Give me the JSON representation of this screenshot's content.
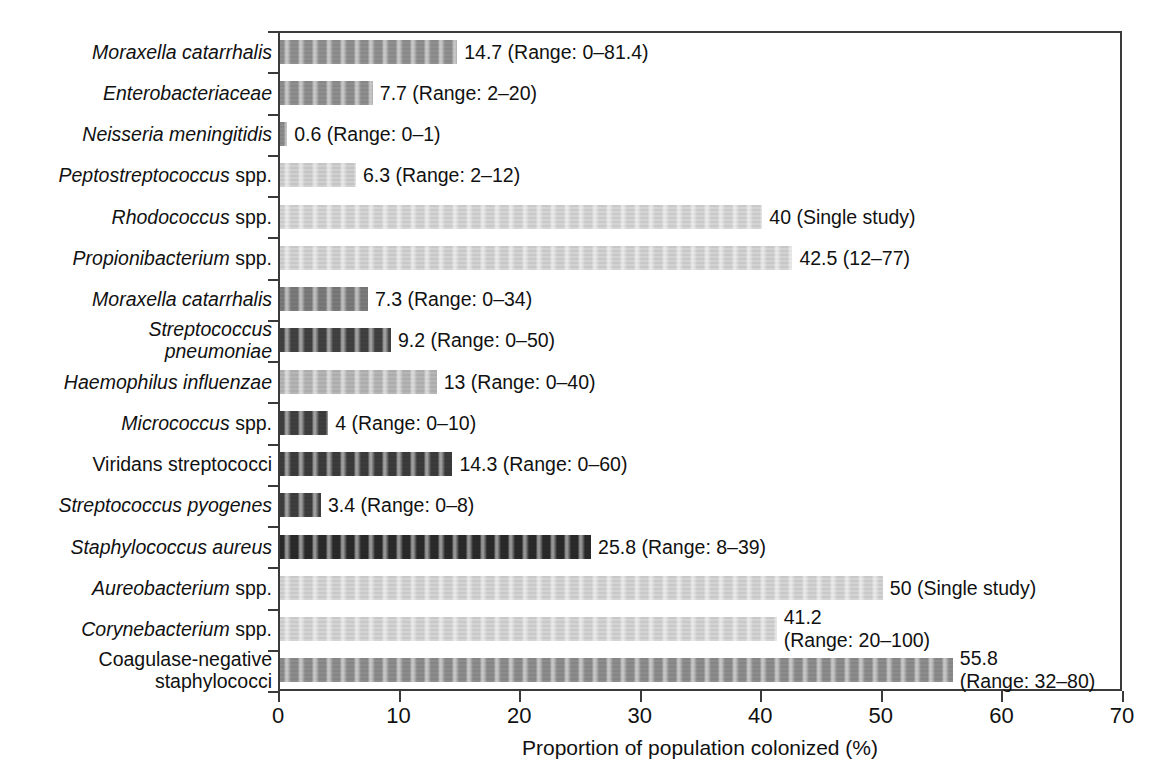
{
  "chart_data": {
    "type": "bar",
    "orientation": "horizontal",
    "title": "",
    "xlabel": "Proportion of population colonized (%)",
    "ylabel": "",
    "xlim": [
      0,
      70
    ],
    "xticks": [
      0,
      10,
      20,
      30,
      40,
      50,
      60,
      70
    ],
    "xtick_labels": [
      "0",
      "10",
      "20",
      "30",
      "40",
      "50",
      "60",
      "70"
    ],
    "grid": false,
    "legend": "none",
    "categories": [
      "Moraxella catarrhalis",
      "Enterobacteriaceae",
      "Neisseria meningitidis",
      "Peptostreptococcus spp.",
      "Rhodococcus spp.",
      "Propionibacterium spp.",
      "Moraxella catarrhalis",
      "Streptococcus\npneumoniae",
      "Haemophilus influenzae",
      "Micrococcus spp.",
      "Viridans streptococci",
      "Streptococcus pyogenes",
      "Staphylococcus aureus",
      "Aureobacterium spp.",
      "Corynebacterium spp.",
      "Coagulase-negative\nstaphylococci"
    ],
    "values": [
      14.7,
      7.7,
      0.6,
      6.3,
      40,
      42.5,
      7.3,
      9.2,
      13,
      4,
      14.3,
      3.4,
      25.8,
      50,
      41.2,
      55.8
    ],
    "value_labels": [
      "14.7 (Range: 0–81.4)",
      "7.7 (Range: 2–20)",
      "0.6 (Range: 0–1)",
      "6.3 (Range: 2–12)",
      "40 (Single study)",
      "42.5 (12–77)",
      "7.3 (Range: 0–34)",
      "9.2 (Range: 0–50)",
      "13 (Range: 0–40)",
      "4 (Range: 0–10)",
      "14.3 (Range: 0–60)",
      "3.4 (Range: 0–8)",
      "25.8 (Range: 8–39)",
      "50 (Single study)",
      "41.2\n(Range: 20–100)",
      "55.8\n(Range: 32–80)"
    ],
    "bar_colors": [
      "#8f8f8f",
      "#8e8e8e",
      "#8b8b8b",
      "#cfcfcf",
      "#d4d4d4",
      "#d2d2d2",
      "#7a7a7a",
      "#414141",
      "#b5b5b5",
      "#3f3f3f",
      "#3c3c3c",
      "#3e3e3e",
      "#2a2a2a",
      "#d3d3d3",
      "#d3d3d3",
      "#8c8c8c"
    ],
    "label_styles": [
      "italic",
      "italic",
      "italic",
      "italic-genus",
      "italic-genus",
      "italic-genus",
      "italic",
      "italic",
      "italic",
      "italic-genus",
      "roman",
      "italic",
      "italic",
      "italic-genus",
      "italic-genus",
      "roman"
    ],
    "label_genus_parts": [
      null,
      null,
      null,
      {
        "italic": "Peptostreptococcus",
        "roman": " spp."
      },
      {
        "italic": "Rhodococcus",
        "roman": " spp."
      },
      {
        "italic": "Propionibacterium",
        "roman": " spp."
      },
      null,
      null,
      null,
      {
        "italic": "Micrococcus",
        "roman": " spp."
      },
      null,
      null,
      null,
      {
        "italic": "Aureobacterium",
        "roman": " spp."
      },
      {
        "italic": "Corynebacterium",
        "roman": " spp."
      },
      null
    ],
    "axis_color": "#3a3a3a"
  }
}
